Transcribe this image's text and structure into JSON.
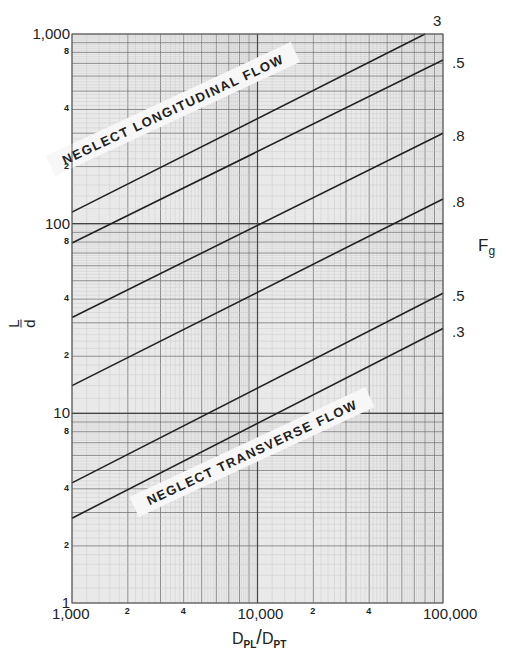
{
  "chart_data": {
    "type": "line",
    "title": "",
    "xlabel": "D_PL / D_PT",
    "ylabel": "L/d",
    "right_label": "F_g",
    "xscale": "log",
    "yscale": "log",
    "xlim": [
      1000,
      100000
    ],
    "ylim": [
      1,
      1000
    ],
    "grid": true,
    "x_ticks_major": [
      "1,000",
      "10,000",
      "100,000"
    ],
    "x_ticks_minor": [
      "2",
      "4",
      "2",
      "4"
    ],
    "y_ticks_major": [
      "1",
      "10",
      "100",
      "1,000"
    ],
    "y_ticks_minor": [
      "2",
      "4",
      "8",
      "2",
      "4",
      "8",
      "2",
      "4",
      "8"
    ],
    "series": [
      {
        "name": "3",
        "x": [
          1000,
          80000
        ],
        "y": [
          115,
          1000
        ]
      },
      {
        "name": ".5",
        "x": [
          1000,
          100000
        ],
        "y": [
          79,
          730
        ]
      },
      {
        "name": ".8",
        "x": [
          1000,
          100000
        ],
        "y": [
          32,
          300
        ]
      },
      {
        "name": ".8",
        "x": [
          1000,
          100000
        ],
        "y": [
          14,
          135
        ]
      },
      {
        "name": ".5",
        "x": [
          1000,
          100000
        ],
        "y": [
          4.3,
          43
        ]
      },
      {
        "name": ".3",
        "x": [
          1000,
          100000
        ],
        "y": [
          2.8,
          28
        ]
      }
    ],
    "annotations": [
      "NEGLECT LONGITUDINAL FLOW",
      "NEGLECT TRANSVERSE FLOW"
    ]
  },
  "labels": {
    "y_major": [
      "1,000",
      "100",
      "10",
      "1"
    ],
    "x_major": [
      "1,000",
      "10,000",
      "100,000"
    ],
    "x_minor": [
      "2",
      "4",
      "2",
      "4"
    ],
    "series_labels": [
      "3",
      ".5",
      ".8",
      ".8",
      ".5",
      ".3"
    ],
    "fg_main": "F",
    "fg_sub": "g",
    "ylabel_num": "L",
    "ylabel_den": "d",
    "xlabel_a": "D",
    "xlabel_a_sub": "PL",
    "xlabel_slash": "/",
    "xlabel_b": "D",
    "xlabel_b_sub": "PT",
    "annotation_top": "NEGLECT LONGITUDINAL FLOW",
    "annotation_bottom": "NEGLECT TRANSVERSE FLOW"
  }
}
